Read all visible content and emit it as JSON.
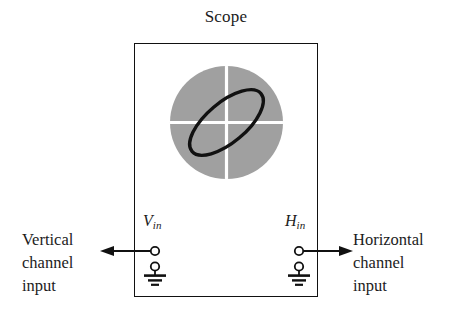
{
  "figure": {
    "kind": "oscilloscope-lissajous-diagram",
    "title": "Scope"
  },
  "crt": {
    "screen_color": "#a0a0a0",
    "graticule_color": "#ffffff",
    "trace_color": "#111111",
    "trace_shape": "ellipse",
    "trace_tilt_degrees": -40
  },
  "terminals": {
    "vertical": {
      "symbol": "V",
      "subscript": "in",
      "ground_icon": "ground-icon",
      "terminal_icon": "terminal-post-icon",
      "arrow_icon": "arrow-left-icon"
    },
    "horizontal": {
      "symbol": "H",
      "subscript": "in",
      "ground_icon": "ground-icon",
      "terminal_icon": "terminal-post-icon",
      "arrow_icon": "arrow-right-icon"
    }
  },
  "annotations": {
    "left": {
      "line1": "Vertical",
      "line2": "channel",
      "line3": "input"
    },
    "right": {
      "line1": "Horizontal",
      "line2": "channel",
      "line3": "input"
    }
  },
  "colors": {
    "ink": "#111111",
    "screen": "#a0a0a0",
    "paper": "#ffffff"
  }
}
